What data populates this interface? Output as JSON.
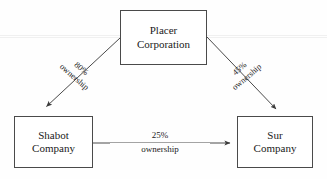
{
  "diagram": {
    "type": "corporate-ownership-hierarchy",
    "background_color": "#fefefe",
    "line_color": "#4a4a4a",
    "text_color": "#1a1a1a",
    "nodes": [
      {
        "id": "placer",
        "name_line_1": "Placer",
        "name_line_2": "Corporation",
        "role": "parent"
      },
      {
        "id": "shabot",
        "name_line_1": "Shabot",
        "name_line_2": "Company",
        "role": "subsidiary"
      },
      {
        "id": "sur",
        "name_line_1": "Sur",
        "name_line_2": "Company",
        "role": "subsidiary"
      }
    ],
    "edges": [
      {
        "id": "placer-to-shabot",
        "from": "placer",
        "to": "shabot",
        "percent": "80%",
        "relation": "ownership",
        "direction": "down-left"
      },
      {
        "id": "placer-to-sur",
        "from": "placer",
        "to": "sur",
        "percent": "45%",
        "relation": "ownership",
        "direction": "down-right"
      },
      {
        "id": "shabot-to-sur",
        "from": "shabot",
        "to": "sur",
        "percent": "25%",
        "relation": "ownership",
        "direction": "right"
      }
    ]
  }
}
